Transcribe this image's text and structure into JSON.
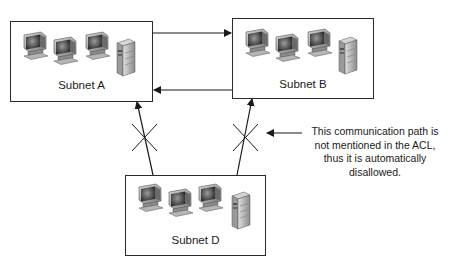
{
  "diagram": {
    "type": "network-acl",
    "subnets": [
      {
        "id": "A",
        "label": "Subnet A",
        "workstations": 3,
        "servers": 1
      },
      {
        "id": "B",
        "label": "Subnet B",
        "workstations": 3,
        "servers": 1
      },
      {
        "id": "D",
        "label": "Subnet D",
        "workstations": 3,
        "servers": 1
      }
    ],
    "connections": [
      {
        "from": "A",
        "to": "B",
        "status": "allowed"
      },
      {
        "from": "B",
        "to": "A",
        "status": "allowed"
      },
      {
        "from": "D",
        "to": "A",
        "status": "blocked"
      },
      {
        "from": "D",
        "to": "B",
        "status": "blocked"
      }
    ],
    "annotation": {
      "lines": [
        "This communication path is",
        "not mentioned in the ACL,",
        "thus it is automatically",
        "disallowed."
      ]
    }
  }
}
